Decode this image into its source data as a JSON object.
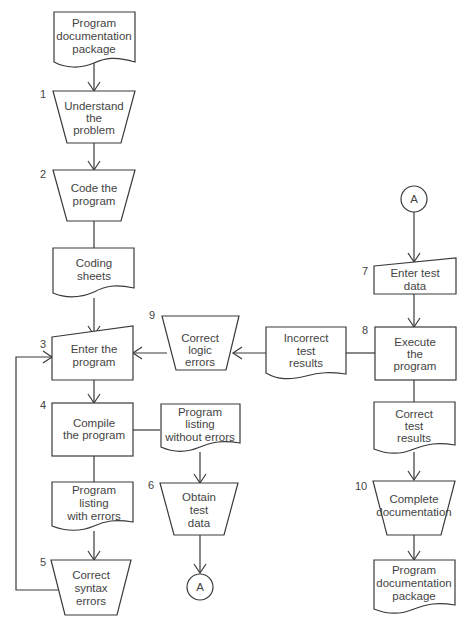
{
  "diagram": {
    "type": "flowchart",
    "colors": {
      "line": "#3a3a3a",
      "text": "#444444",
      "background": "#ffffff"
    },
    "nodes": {
      "doc_start": {
        "lines": [
          "Program",
          "documentation",
          "package"
        ]
      },
      "step1": {
        "number": "1",
        "lines": [
          "Understand",
          "the",
          "problem"
        ]
      },
      "step2": {
        "number": "2",
        "lines": [
          "Code the",
          "program"
        ]
      },
      "coding_sheets": {
        "lines": [
          "Coding",
          "sheets"
        ]
      },
      "step3": {
        "number": "3",
        "lines": [
          "Enter the",
          "program"
        ]
      },
      "step4": {
        "number": "4",
        "lines": [
          "Compile",
          "the program"
        ]
      },
      "listing_errors": {
        "lines": [
          "Program",
          "listing",
          "with errors"
        ]
      },
      "step5": {
        "number": "5",
        "lines": [
          "Correct",
          "syntax",
          "errors"
        ]
      },
      "listing_ok": {
        "lines": [
          "Program",
          "listing",
          "without errors"
        ]
      },
      "step6": {
        "number": "6",
        "lines": [
          "Obtain",
          "test",
          "data"
        ]
      },
      "connector_out": {
        "label": "A"
      },
      "connector_in": {
        "label": "A"
      },
      "step7": {
        "number": "7",
        "lines": [
          "Enter test",
          "data"
        ]
      },
      "step8": {
        "number": "8",
        "lines": [
          "Execute",
          "the",
          "program"
        ]
      },
      "incorrect_results": {
        "lines": [
          "Incorrect",
          "test",
          "results"
        ]
      },
      "step9": {
        "number": "9",
        "lines": [
          "Correct",
          "logic",
          "errors"
        ]
      },
      "correct_results": {
        "lines": [
          "Correct",
          "test",
          "results"
        ]
      },
      "step10": {
        "number": "10",
        "lines": [
          "Complete",
          "documentation"
        ]
      },
      "doc_end": {
        "lines": [
          "Program",
          "documentation",
          "package"
        ]
      }
    }
  }
}
